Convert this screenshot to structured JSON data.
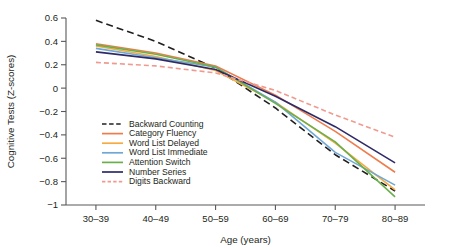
{
  "chart_data": {
    "type": "line",
    "title": "",
    "xlabel": "Age (years)",
    "ylabel": "Cognitive Tests (Z-scores)",
    "categories": [
      "30–39",
      "40–49",
      "50–59",
      "60–69",
      "70–79",
      "80–89"
    ],
    "ylim": [
      -1,
      0.6
    ],
    "yticks": [
      0.6,
      0.4,
      0.2,
      0,
      -0.2,
      -0.4,
      -0.6,
      -0.8,
      -1
    ],
    "ytick_labels": [
      "0.6",
      "0.4",
      "0.2",
      "0",
      "−0.2",
      "−0.4",
      "−0.6",
      "−0.8",
      "−1"
    ],
    "grid": false,
    "legend_position": "lower-left-inside",
    "series": [
      {
        "name": "Backward Counting",
        "color": "#231f20",
        "dash": "7,4",
        "values": [
          0.58,
          0.4,
          0.17,
          -0.17,
          -0.57,
          -0.88
        ]
      },
      {
        "name": "Category Fluency",
        "color": "#ef7c4c",
        "dash": "none",
        "values": [
          0.38,
          0.3,
          0.19,
          -0.06,
          -0.37,
          -0.72
        ]
      },
      {
        "name": "Word List Delayed",
        "color": "#f5ab41",
        "dash": "none",
        "values": [
          0.36,
          0.27,
          0.15,
          -0.12,
          -0.47,
          -0.87
        ]
      },
      {
        "name": "Word List Immediate",
        "color": "#6fa8d6",
        "dash": "none",
        "values": [
          0.34,
          0.26,
          0.18,
          -0.12,
          -0.55,
          -0.83
        ]
      },
      {
        "name": "Attention Switch",
        "color": "#6ab04a",
        "dash": "none",
        "values": [
          0.37,
          0.29,
          0.18,
          -0.13,
          -0.46,
          -0.93
        ]
      },
      {
        "name": "Number Series",
        "color": "#2e2a68",
        "dash": "none",
        "values": [
          0.31,
          0.25,
          0.16,
          -0.07,
          -0.33,
          -0.64
        ]
      },
      {
        "name": "Digits Backward",
        "color": "#f09a8f",
        "dash": "5,3",
        "values": [
          0.22,
          0.19,
          0.13,
          -0.02,
          -0.23,
          -0.42
        ]
      }
    ]
  }
}
